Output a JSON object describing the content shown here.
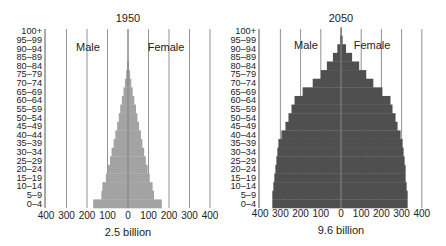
{
  "chart_data": [
    {
      "type": "bar",
      "subtype": "population-pyramid",
      "title": "1950",
      "total_label": "2.5 billion",
      "left_label": "Male",
      "right_label": "Female",
      "xlabel": "",
      "ylabel": "",
      "x_range": [
        -400,
        400
      ],
      "x_ticks": [
        -400,
        -300,
        -200,
        -100,
        0,
        100,
        200,
        300,
        400
      ],
      "x_tick_labels": [
        "400",
        "300",
        "200",
        "100",
        "0",
        "100",
        "200",
        "300",
        "400"
      ],
      "grid": true,
      "fill_color": "#a3a3a3",
      "categories": [
        "100+",
        "95–99",
        "90–94",
        "85–89",
        "80–84",
        "75–79",
        "70–74",
        "65–69",
        "60–64",
        "55–59",
        "50–54",
        "45–49",
        "40–44",
        "35–39",
        "30–34",
        "25–29",
        "20–24",
        "15–19",
        "10–14",
        "5–9",
        "0–4"
      ],
      "series": [
        {
          "name": "Male",
          "values": [
            0,
            0,
            0,
            0,
            5,
            9,
            15,
            22,
            30,
            38,
            45,
            53,
            62,
            70,
            80,
            88,
            98,
            108,
            125,
            130,
            170
          ]
        },
        {
          "name": "Female",
          "values": [
            0,
            0,
            0,
            0,
            5,
            10,
            16,
            23,
            31,
            39,
            46,
            54,
            63,
            70,
            79,
            87,
            96,
            106,
            120,
            127,
            165
          ]
        }
      ]
    },
    {
      "type": "bar",
      "subtype": "population-pyramid",
      "title": "2050",
      "total_label": "9.6 billion",
      "left_label": "Male",
      "right_label": "Female",
      "xlabel": "",
      "ylabel": "",
      "x_range": [
        -400,
        400
      ],
      "x_ticks": [
        -400,
        -300,
        -200,
        -100,
        0,
        100,
        200,
        300,
        400
      ],
      "x_tick_labels": [
        "400",
        "300",
        "200",
        "100",
        "0",
        "100",
        "200",
        "300",
        "400"
      ],
      "grid": true,
      "fill_color": "#4f4f4f",
      "categories": [
        "100+",
        "95–99",
        "90–94",
        "85–89",
        "80–84",
        "75–79",
        "70–74",
        "65–69",
        "60–64",
        "55–59",
        "50–54",
        "45–49",
        "40–44",
        "35–39",
        "30–34",
        "25–29",
        "20–24",
        "15–19",
        "10–14",
        "5–9",
        "0–4"
      ],
      "series": [
        {
          "name": "Male",
          "values": [
            2,
            5,
            18,
            40,
            70,
            100,
            140,
            190,
            230,
            245,
            260,
            275,
            295,
            310,
            315,
            320,
            325,
            330,
            335,
            340,
            340
          ]
        },
        {
          "name": "Female",
          "values": [
            3,
            8,
            25,
            55,
            90,
            125,
            160,
            205,
            245,
            255,
            270,
            280,
            295,
            305,
            310,
            315,
            320,
            320,
            325,
            330,
            330
          ]
        }
      ]
    }
  ]
}
